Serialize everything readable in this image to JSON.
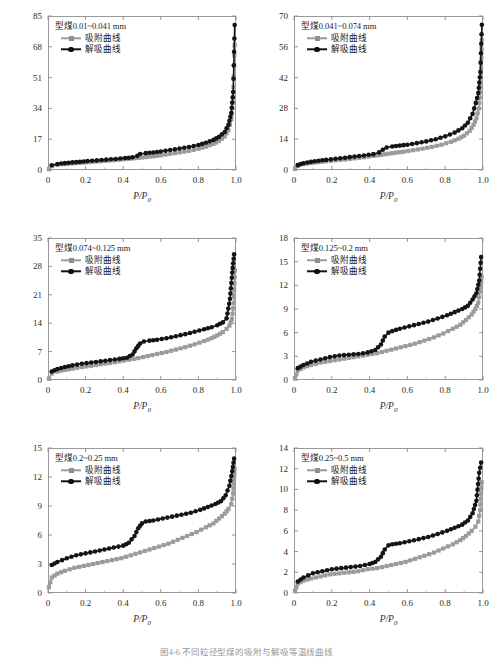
{
  "figure": {
    "caption": "图4-6  不同粒径型煤的吸附与解吸等温线曲线",
    "x_axis_label": "P/P",
    "x_axis_label_sub": "0",
    "y_axis_label": "标准状况下的气体体积/(mL/g)",
    "legend": {
      "adsorption_label": "吸附曲线",
      "desorption_label": "解吸曲线",
      "adsorption_color": "#9b9b9b",
      "desorption_color": "#141414",
      "adsorption_marker": "square-marker",
      "desorption_marker": "circle-marker"
    },
    "x_ticks": [
      "0",
      "0.2",
      "0.4",
      "0.6",
      "0.8",
      "1.0"
    ],
    "x_tick_values": [
      0,
      0.2,
      0.4,
      0.6,
      0.8,
      1.0
    ]
  },
  "chart_data": [
    {
      "type": "line",
      "panel_index": 0,
      "title": "型煤0.01~0.041 mm",
      "xlabel": "P/P0",
      "ylabel": "标准状况下的气体体积/(mL/g)",
      "xlim": [
        0,
        1.0
      ],
      "ylim": [
        0,
        85
      ],
      "xticks": [
        0,
        0.2,
        0.4,
        0.6,
        0.8,
        1.0
      ],
      "yticks": [
        0,
        17,
        34,
        51,
        68,
        85
      ],
      "ytick_labels": [
        "0",
        "17",
        "34",
        "51",
        "68",
        "85"
      ],
      "grid": false,
      "legend_position": "upper-left",
      "series": [
        {
          "name": "吸附曲线",
          "marker": "square",
          "color": "#9b9b9b",
          "x": [
            0.005,
            0.02,
            0.05,
            0.08,
            0.12,
            0.16,
            0.2,
            0.25,
            0.3,
            0.35,
            0.4,
            0.44,
            0.48,
            0.52,
            0.56,
            0.6,
            0.65,
            0.7,
            0.75,
            0.8,
            0.84,
            0.88,
            0.91,
            0.94,
            0.96,
            0.975,
            0.985,
            0.993
          ],
          "values": [
            0.4,
            2.1,
            2.8,
            3.2,
            3.6,
            3.9,
            4.2,
            4.6,
            5.0,
            5.4,
            5.9,
            6.3,
            6.7,
            7.1,
            7.6,
            8.1,
            8.9,
            9.7,
            10.6,
            11.7,
            12.9,
            14.4,
            16.0,
            18.5,
            22.0,
            28.0,
            40.0,
            69.0
          ]
        },
        {
          "name": "解吸曲线",
          "marker": "circle",
          "color": "#141414",
          "x": [
            0.02,
            0.05,
            0.09,
            0.13,
            0.17,
            0.21,
            0.26,
            0.31,
            0.36,
            0.41,
            0.45,
            0.475,
            0.49,
            0.52,
            0.56,
            0.6,
            0.65,
            0.7,
            0.75,
            0.8,
            0.84,
            0.88,
            0.91,
            0.94,
            0.96,
            0.975,
            0.985,
            0.993
          ],
          "values": [
            2.6,
            3.3,
            3.8,
            4.2,
            4.5,
            4.9,
            5.3,
            5.7,
            6.1,
            6.6,
            7.0,
            7.8,
            8.8,
            9.3,
            9.7,
            10.2,
            11.0,
            11.8,
            12.7,
            13.8,
            15.0,
            16.6,
            18.3,
            21.0,
            25.0,
            31.5,
            43.0,
            80.0
          ]
        }
      ]
    },
    {
      "type": "line",
      "panel_index": 1,
      "title": "型煤0.041~0.074 mm",
      "xlabel": "P/P0",
      "ylabel": "标准状况下的气体体积/(mL/g)",
      "xlim": [
        0,
        1.0
      ],
      "ylim": [
        0,
        70
      ],
      "xticks": [
        0,
        0.2,
        0.4,
        0.6,
        0.8,
        1.0
      ],
      "yticks": [
        0,
        14,
        28,
        42,
        56,
        70
      ],
      "ytick_labels": [
        "0",
        "14",
        "28",
        "42",
        "56",
        "70"
      ],
      "grid": false,
      "legend_position": "upper-left",
      "series": [
        {
          "name": "吸附曲线",
          "marker": "square",
          "color": "#9b9b9b",
          "x": [
            0.005,
            0.02,
            0.05,
            0.09,
            0.13,
            0.17,
            0.22,
            0.27,
            0.32,
            0.37,
            0.42,
            0.46,
            0.5,
            0.54,
            0.58,
            0.63,
            0.68,
            0.73,
            0.78,
            0.83,
            0.87,
            0.9,
            0.93,
            0.95,
            0.965,
            0.978,
            0.988,
            0.994
          ],
          "values": [
            0.5,
            1.9,
            2.7,
            3.2,
            3.6,
            4.0,
            4.4,
            4.8,
            5.3,
            5.8,
            6.4,
            6.9,
            7.4,
            7.9,
            8.3,
            9.0,
            9.7,
            10.5,
            11.5,
            12.8,
            14.2,
            15.6,
            17.8,
            20.5,
            23.5,
            28.0,
            38.0,
            59.0
          ]
        },
        {
          "name": "解吸曲线",
          "marker": "circle",
          "color": "#141414",
          "x": [
            0.02,
            0.05,
            0.09,
            0.13,
            0.17,
            0.22,
            0.27,
            0.32,
            0.37,
            0.42,
            0.45,
            0.47,
            0.49,
            0.52,
            0.56,
            0.6,
            0.65,
            0.7,
            0.75,
            0.8,
            0.85,
            0.89,
            0.92,
            0.945,
            0.962,
            0.975,
            0.986,
            0.994
          ],
          "values": [
            2.2,
            3.1,
            3.7,
            4.2,
            4.6,
            5.1,
            5.6,
            6.1,
            6.6,
            7.2,
            8.0,
            9.2,
            10.2,
            10.7,
            11.1,
            11.5,
            12.2,
            13.0,
            14.0,
            15.3,
            17.0,
            19.0,
            21.5,
            25.5,
            30.5,
            35.0,
            44.5,
            66.0
          ]
        }
      ]
    },
    {
      "type": "line",
      "panel_index": 2,
      "title": "型煤0.074~0.125 mm",
      "xlabel": "P/P0",
      "ylabel": "标准状况下的气体体积/(mL/g)",
      "xlim": [
        0,
        1.0
      ],
      "ylim": [
        0,
        35
      ],
      "xticks": [
        0,
        0.2,
        0.4,
        0.6,
        0.8,
        1.0
      ],
      "yticks": [
        0,
        7,
        14,
        21,
        28,
        35
      ],
      "ytick_labels": [
        "0",
        "7",
        "14",
        "21",
        "28",
        "35"
      ],
      "grid": false,
      "legend_position": "upper-left",
      "series": [
        {
          "name": "吸附曲线",
          "marker": "square",
          "color": "#9b9b9b",
          "x": [
            0.005,
            0.02,
            0.05,
            0.09,
            0.13,
            0.18,
            0.23,
            0.28,
            0.33,
            0.38,
            0.43,
            0.48,
            0.53,
            0.58,
            0.63,
            0.68,
            0.73,
            0.78,
            0.83,
            0.87,
            0.9,
            0.93,
            0.95,
            0.965,
            0.978,
            0.988,
            0.994
          ],
          "values": [
            0.3,
            1.6,
            2.1,
            2.5,
            2.8,
            3.2,
            3.5,
            3.9,
            4.2,
            4.6,
            5.0,
            5.4,
            5.9,
            6.4,
            6.9,
            7.5,
            8.1,
            8.8,
            9.6,
            10.3,
            11.0,
            11.8,
            12.6,
            13.4,
            15.0,
            19.0,
            27.0
          ]
        },
        {
          "name": "解吸曲线",
          "marker": "circle",
          "color": "#141414",
          "x": [
            0.02,
            0.05,
            0.09,
            0.13,
            0.18,
            0.23,
            0.28,
            0.33,
            0.38,
            0.42,
            0.45,
            0.47,
            0.49,
            0.51,
            0.54,
            0.58,
            0.63,
            0.68,
            0.73,
            0.78,
            0.83,
            0.87,
            0.9,
            0.93,
            0.95,
            0.968,
            0.98,
            0.99
          ],
          "values": [
            2.1,
            2.7,
            3.2,
            3.6,
            4.0,
            4.3,
            4.6,
            4.9,
            5.2,
            5.5,
            6.3,
            7.8,
            9.0,
            9.5,
            9.7,
            9.9,
            10.3,
            10.8,
            11.3,
            11.9,
            12.5,
            13.0,
            13.5,
            14.2,
            15.2,
            20.0,
            26.5,
            31.0
          ]
        }
      ]
    },
    {
      "type": "line",
      "panel_index": 3,
      "title": "型煤0.125~0.2 mm",
      "xlabel": "P/P0",
      "ylabel": "标准状况下的气体体积/(mL/g)",
      "xlim": [
        0,
        1.0
      ],
      "ylim": [
        0,
        18
      ],
      "xticks": [
        0,
        0.2,
        0.4,
        0.6,
        0.8,
        1.0
      ],
      "yticks": [
        0,
        3,
        6,
        9,
        12,
        15,
        18
      ],
      "ytick_labels": [
        "0",
        "3",
        "6",
        "9",
        "12",
        "15",
        "18"
      ],
      "grid": false,
      "legend_position": "upper-left",
      "series": [
        {
          "name": "吸附曲线",
          "marker": "square",
          "color": "#9b9b9b",
          "x": [
            0.005,
            0.02,
            0.05,
            0.09,
            0.14,
            0.19,
            0.24,
            0.29,
            0.34,
            0.39,
            0.44,
            0.49,
            0.54,
            0.59,
            0.64,
            0.69,
            0.74,
            0.79,
            0.84,
            0.88,
            0.91,
            0.94,
            0.96,
            0.975,
            0.985,
            0.993
          ],
          "values": [
            0.2,
            1.2,
            1.6,
            1.9,
            2.2,
            2.4,
            2.6,
            2.8,
            3.0,
            3.2,
            3.4,
            3.7,
            4.0,
            4.3,
            4.6,
            5.0,
            5.4,
            5.9,
            6.5,
            7.0,
            7.6,
            8.3,
            9.0,
            9.8,
            11.2,
            13.0
          ]
        },
        {
          "name": "解吸曲线",
          "marker": "circle",
          "color": "#141414",
          "x": [
            0.02,
            0.05,
            0.09,
            0.14,
            0.19,
            0.24,
            0.29,
            0.34,
            0.39,
            0.43,
            0.46,
            0.48,
            0.5,
            0.52,
            0.56,
            0.61,
            0.66,
            0.71,
            0.76,
            0.81,
            0.85,
            0.89,
            0.92,
            0.945,
            0.965,
            0.98,
            0.99
          ],
          "values": [
            1.5,
            1.9,
            2.3,
            2.6,
            2.9,
            3.1,
            3.2,
            3.3,
            3.5,
            3.8,
            4.5,
            5.5,
            6.0,
            6.2,
            6.5,
            6.8,
            7.1,
            7.4,
            7.8,
            8.2,
            8.6,
            9.0,
            9.4,
            10.2,
            11.0,
            12.6,
            15.6
          ]
        }
      ]
    },
    {
      "type": "line",
      "panel_index": 4,
      "title": "型煤0.2~0.25 mm",
      "xlabel": "P/P0",
      "ylabel": "标准状况下的气体体积/(mL/g)",
      "xlim": [
        0,
        1.0
      ],
      "ylim": [
        0,
        15
      ],
      "xticks": [
        0,
        0.2,
        0.4,
        0.6,
        0.8,
        1.0
      ],
      "yticks": [
        0,
        3,
        6,
        9,
        12,
        15
      ],
      "ytick_labels": [
        "0",
        "3",
        "6",
        "9",
        "12",
        "15"
      ],
      "grid": false,
      "legend_position": "upper-left",
      "series": [
        {
          "name": "吸附曲线",
          "marker": "square",
          "color": "#9b9b9b",
          "x": [
            0.005,
            0.02,
            0.05,
            0.09,
            0.14,
            0.19,
            0.24,
            0.29,
            0.34,
            0.39,
            0.44,
            0.49,
            0.54,
            0.59,
            0.64,
            0.69,
            0.74,
            0.79,
            0.84,
            0.88,
            0.91,
            0.94,
            0.96,
            0.975,
            0.985,
            0.993
          ],
          "values": [
            0.6,
            1.6,
            2.0,
            2.3,
            2.6,
            2.8,
            3.0,
            3.2,
            3.4,
            3.6,
            3.9,
            4.2,
            4.5,
            4.8,
            5.1,
            5.5,
            5.9,
            6.3,
            6.8,
            7.2,
            7.7,
            8.2,
            8.7,
            9.2,
            10.3,
            12.8
          ]
        },
        {
          "name": "解吸曲线",
          "marker": "circle",
          "color": "#141414",
          "x": [
            0.02,
            0.05,
            0.1,
            0.15,
            0.2,
            0.25,
            0.3,
            0.35,
            0.4,
            0.43,
            0.46,
            0.48,
            0.5,
            0.52,
            0.56,
            0.61,
            0.66,
            0.71,
            0.76,
            0.81,
            0.85,
            0.89,
            0.92,
            0.945,
            0.965,
            0.98,
            0.99
          ],
          "values": [
            2.9,
            3.2,
            3.6,
            3.9,
            4.1,
            4.3,
            4.5,
            4.7,
            4.9,
            5.2,
            5.9,
            6.7,
            7.2,
            7.4,
            7.5,
            7.7,
            7.9,
            8.1,
            8.3,
            8.6,
            8.9,
            9.2,
            9.5,
            10.1,
            11.1,
            12.6,
            13.9
          ]
        }
      ]
    },
    {
      "type": "line",
      "panel_index": 5,
      "title": "型煤0.25~0.5 mm",
      "xlabel": "P/P0",
      "ylabel": "标准状况下的气体体积/(mL/g)",
      "xlim": [
        0,
        1.0
      ],
      "ylim": [
        0,
        14
      ],
      "xticks": [
        0,
        0.2,
        0.4,
        0.6,
        0.8,
        1.0
      ],
      "yticks": [
        0,
        2,
        4,
        6,
        8,
        10,
        12,
        14
      ],
      "ytick_labels": [
        "0",
        "2",
        "4",
        "6",
        "8",
        "10",
        "12",
        "14"
      ],
      "grid": false,
      "legend_position": "upper-left",
      "series": [
        {
          "name": "吸附曲线",
          "marker": "square",
          "color": "#9b9b9b",
          "x": [
            0.005,
            0.02,
            0.05,
            0.09,
            0.14,
            0.19,
            0.24,
            0.29,
            0.34,
            0.39,
            0.44,
            0.49,
            0.54,
            0.59,
            0.64,
            0.69,
            0.74,
            0.79,
            0.84,
            0.88,
            0.91,
            0.94,
            0.96,
            0.975,
            0.985,
            0.993
          ],
          "values": [
            0.2,
            0.9,
            1.2,
            1.4,
            1.6,
            1.8,
            1.9,
            2.0,
            2.1,
            2.3,
            2.4,
            2.6,
            2.8,
            3.0,
            3.3,
            3.6,
            3.9,
            4.3,
            4.7,
            5.1,
            5.5,
            6.0,
            6.4,
            6.9,
            8.0,
            10.7
          ]
        },
        {
          "name": "解吸曲线",
          "marker": "circle",
          "color": "#141414",
          "x": [
            0.02,
            0.05,
            0.1,
            0.15,
            0.2,
            0.25,
            0.3,
            0.35,
            0.4,
            0.43,
            0.46,
            0.48,
            0.5,
            0.52,
            0.56,
            0.61,
            0.66,
            0.71,
            0.76,
            0.81,
            0.85,
            0.89,
            0.92,
            0.945,
            0.965,
            0.98,
            0.99
          ],
          "values": [
            1.1,
            1.5,
            1.9,
            2.1,
            2.3,
            2.4,
            2.5,
            2.6,
            2.8,
            3.0,
            3.5,
            4.2,
            4.6,
            4.7,
            4.8,
            5.0,
            5.2,
            5.4,
            5.7,
            6.0,
            6.3,
            6.6,
            7.0,
            7.7,
            8.9,
            11.6,
            12.6
          ]
        }
      ]
    }
  ]
}
